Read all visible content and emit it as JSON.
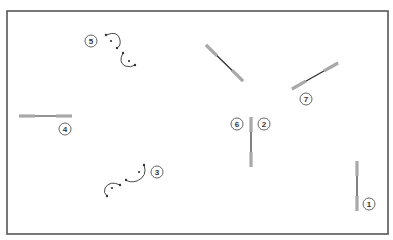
{
  "diagram": {
    "frame": {
      "x": 7,
      "y": 11,
      "width": 381,
      "height": 223,
      "stroke": "#555555"
    },
    "colors": {
      "rod_end": "#a8a8a8",
      "rod_core": "#2a2a2a",
      "arc": "#333333",
      "label_stroke": "#555555"
    },
    "rods": [
      {
        "id": "rod-1",
        "x1": 357,
        "y1": 161,
        "x2": 357,
        "y2": 211,
        "label": "1"
      },
      {
        "id": "rod-2-6",
        "x1": 251,
        "y1": 117,
        "x2": 251,
        "y2": 167,
        "label": "2/6"
      },
      {
        "id": "rod-4",
        "x1": 19,
        "y1": 116,
        "x2": 72,
        "y2": 116,
        "label": "4"
      },
      {
        "id": "rod-top",
        "x1": 206,
        "y1": 45,
        "x2": 243,
        "y2": 81,
        "label": ""
      },
      {
        "id": "rod-7",
        "x1": 292,
        "y1": 89,
        "x2": 338,
        "y2": 63,
        "label": "7"
      }
    ],
    "labels": [
      {
        "text": "1",
        "cx": 369,
        "cy": 204
      },
      {
        "text": "2",
        "cx": 264,
        "cy": 124
      },
      {
        "text": "3",
        "cx": 157,
        "cy": 172
      },
      {
        "text": "4",
        "cx": 65,
        "cy": 129
      },
      {
        "text": "5",
        "cx": 91,
        "cy": 41
      },
      {
        "text": "6",
        "cx": 237,
        "cy": 124
      },
      {
        "text": "7",
        "cx": 306,
        "cy": 99
      }
    ],
    "arc_pairs": [
      {
        "id": "arcs-5",
        "arcs": [
          {
            "d": "M106,35 Q118,30 120,40 Q121,46 117,48",
            "center": [
              111,
              41
            ],
            "ends": [
              [
                106,
                35
              ],
              [
                117,
                48
              ]
            ]
          },
          {
            "d": "M123,53 Q118,62 125,66 Q131,68 135,65",
            "center": [
              129,
              61
            ],
            "ends": [
              [
                123,
                53
              ],
              [
                135,
                65
              ]
            ]
          }
        ]
      },
      {
        "id": "arcs-3",
        "arcs": [
          {
            "d": "M144,165 Q148,176 137,181 Q130,183 126,180",
            "center": [
              139,
              172
            ],
            "ends": [
              [
                144,
                165
              ],
              [
                126,
                180
              ]
            ]
          },
          {
            "d": "M120,185 Q110,180 105,188 Q103,193 107,196",
            "center": [
              112,
              188
            ],
            "ends": [
              [
                120,
                185
              ],
              [
                107,
                196
              ]
            ]
          }
        ]
      }
    ]
  }
}
